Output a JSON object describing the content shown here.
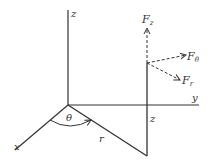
{
  "diagram": {
    "axes": {
      "x": "x",
      "y": "y",
      "z": "z"
    },
    "labels": {
      "theta": "θ",
      "r": "r",
      "z_height": "z",
      "Fz_main": "F",
      "Fz_sub": "z",
      "Ftheta_main": "F",
      "Ftheta_sub": "θ",
      "Fr_main": "F",
      "Fr_sub": "r"
    },
    "colors": {
      "line": "#333333",
      "background": "#ffffff"
    }
  }
}
